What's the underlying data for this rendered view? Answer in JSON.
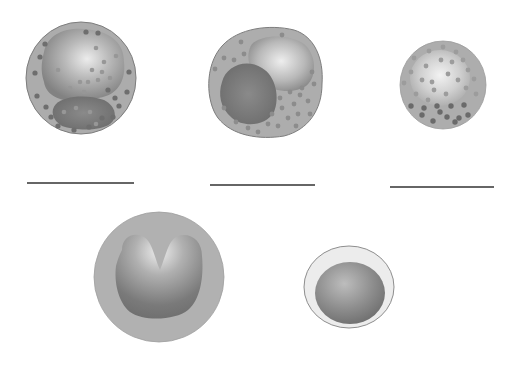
{
  "diagram": {
    "background": "#ffffff",
    "colors": {
      "cytoplasm": "#a9a9a9",
      "cytoplasm_light": "#b4b4b4",
      "cell_outline": "#7c7c7c",
      "nucleus_dark": "#6c6c6c",
      "nucleus_light": "#e6e6e6",
      "granule": "#6e6e6e",
      "granule_light": "#8f8f8f",
      "lymph_rim": "#ececec",
      "line": "#333333"
    },
    "cells": [
      {
        "id": "cell-1",
        "kind": "granulocyte-multilobed",
        "cx": 81,
        "cy": 78,
        "rx": 55,
        "ry": 56,
        "granule_count": 34
      },
      {
        "id": "cell-2",
        "kind": "granulocyte-bilobed",
        "cx": 264,
        "cy": 82,
        "rx": 57,
        "ry": 56,
        "granule_count": 26
      },
      {
        "id": "cell-3",
        "kind": "granulocyte-dense-granules",
        "cx": 443,
        "cy": 84,
        "rx": 43,
        "ry": 44,
        "granule_count": 36
      },
      {
        "id": "cell-4",
        "kind": "horseshoe-nucleus",
        "cx": 159,
        "cy": 277,
        "rx": 65,
        "ry": 65
      },
      {
        "id": "cell-5",
        "kind": "round-nucleus-thin-rim",
        "cx": 349,
        "cy": 287,
        "rx": 45,
        "ry": 41
      }
    ],
    "label_lines": [
      {
        "id": "label-line-1",
        "x1": 27,
        "x2": 134,
        "y": 183,
        "value": ""
      },
      {
        "id": "label-line-2",
        "x1": 210,
        "x2": 315,
        "y": 185,
        "value": ""
      },
      {
        "id": "label-line-3",
        "x1": 390,
        "x2": 494,
        "y": 187,
        "value": ""
      }
    ]
  }
}
